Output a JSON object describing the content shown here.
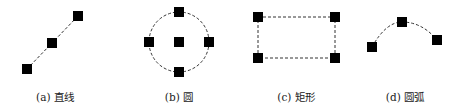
{
  "figure": {
    "colors": {
      "stroke": "#333333",
      "handle": "#000000",
      "background": "#ffffff"
    },
    "panels": [
      {
        "id": "a",
        "label": "(a) 直线",
        "shape": "line",
        "label_x": 55,
        "handles": [
          [
            27,
            69
          ],
          [
            52,
            43
          ],
          [
            78,
            16
          ]
        ]
      },
      {
        "id": "b",
        "label": "(b) 圆",
        "shape": "circle",
        "label_x": 179,
        "center": [
          179,
          42
        ],
        "radius": 30,
        "handles": [
          [
            179,
            12
          ],
          [
            149,
            42
          ],
          [
            179,
            42
          ],
          [
            209,
            42
          ],
          [
            179,
            72
          ]
        ]
      },
      {
        "id": "c",
        "label": "(c) 矩形",
        "shape": "rectangle",
        "label_x": 296,
        "handles": [
          [
            258,
            17
          ],
          [
            335,
            17
          ],
          [
            258,
            58
          ],
          [
            335,
            58
          ]
        ]
      },
      {
        "id": "d",
        "label": "(d) 圆弧",
        "shape": "arc",
        "label_x": 405,
        "handles": [
          [
            372,
            47
          ],
          [
            402,
            22
          ],
          [
            437,
            40
          ]
        ]
      }
    ]
  }
}
